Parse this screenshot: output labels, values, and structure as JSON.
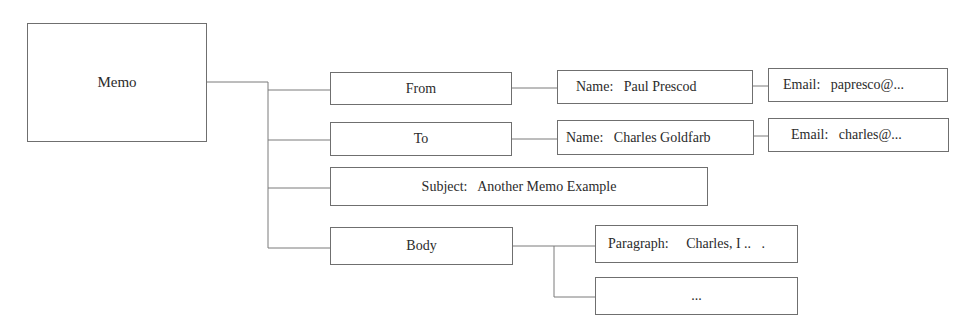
{
  "diagram": {
    "root": {
      "label": "Memo"
    },
    "from": {
      "label": "From",
      "name": "Name:   Paul Prescod",
      "email": "Email:   papresco@..."
    },
    "to": {
      "label": "To",
      "name": "Name:   Charles Goldfarb",
      "email": "Email:   charles@..."
    },
    "subject": {
      "label": "Subject:   Another Memo Example"
    },
    "body": {
      "label": "Body",
      "paragraph": "Paragraph:     Charles, I ..   .",
      "more": "..."
    },
    "colors": {
      "line": "#7a7a7a",
      "text": "#2b2b2b",
      "background": "#ffffff"
    }
  }
}
